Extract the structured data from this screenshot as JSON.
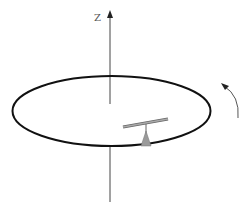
{
  "diagram": {
    "axis_label": "Z",
    "elements": {
      "axis": {
        "name": "vertical rotation axis",
        "label": "Z"
      },
      "disc": {
        "name": "rotating disc (ellipse in perspective)"
      },
      "seesaw": {
        "name": "balance beam on triangular pivot"
      },
      "rotation_arrow": {
        "name": "counter-clockwise rotation indicator"
      }
    },
    "colors": {
      "stroke": "#111111",
      "axis": "#444444",
      "beam": "#888888",
      "pivot": "#999999",
      "arrow": "#555555"
    }
  }
}
